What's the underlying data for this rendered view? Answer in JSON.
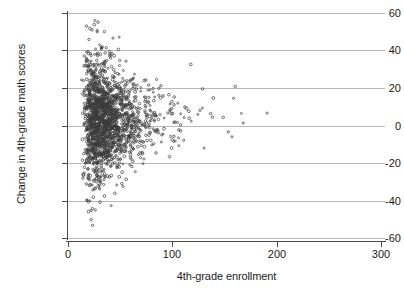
{
  "chart_data": {
    "type": "scatter",
    "title": "",
    "xlabel": "4th-grade enrollment",
    "ylabel": "Change in 4th-grade math scores",
    "xlim": [
      0,
      300
    ],
    "ylim": [
      -60,
      60
    ],
    "xticks": [
      0,
      100,
      200,
      300
    ],
    "yticks": [
      -60,
      -40,
      -20,
      0,
      20,
      40,
      60
    ],
    "xtick_labels": [
      "0",
      "100",
      "200",
      "300"
    ],
    "ytick_labels": [
      "-60",
      "-40",
      "-20",
      "0",
      "20",
      "40",
      "60"
    ],
    "grid": "horizontal",
    "legend": "none",
    "marker": "open-circle",
    "marker_color": "#3b3b3b",
    "n_points": 1800,
    "series": [
      {
        "name": "schools",
        "x_range": [
          10,
          285
        ],
        "y_center": 3,
        "spread_model": "sd proportional to 1/sqrt(enrollment)",
        "visible_extremes": {
          "y_max": 59,
          "y_min": -56,
          "x_max": 283,
          "x_min": 11
        }
      }
    ]
  },
  "axes": {
    "y_axis_title": "Change in 4th-grade math scores",
    "x_axis_title": "4th-grade enrollment"
  }
}
